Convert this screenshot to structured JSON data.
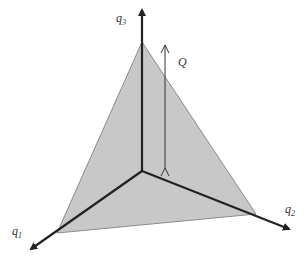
{
  "diagram": {
    "axes": [
      {
        "name": "q1",
        "base": "q",
        "sub": "1"
      },
      {
        "name": "q2",
        "base": "q",
        "sub": "2"
      },
      {
        "name": "q3",
        "base": "q",
        "sub": "3"
      }
    ],
    "arrow_label": "Q",
    "colors": {
      "fill": "#c8c8c8",
      "edge": "#8a8a8a",
      "axis": "#222222"
    }
  }
}
